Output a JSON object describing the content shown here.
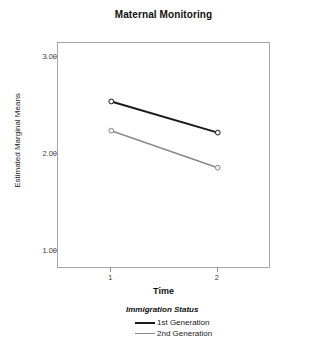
{
  "chart_data": {
    "type": "line",
    "title": "Maternal Monitoring",
    "xlabel": "Time",
    "ylabel": "Estimated Marginal Means",
    "x": [
      1,
      2
    ],
    "xticklabels": [
      "1",
      "2"
    ],
    "yticklabels": [
      "1.00",
      "2.00",
      "3.00"
    ],
    "yticks": [
      1.0,
      2.0,
      3.0
    ],
    "ylim": [
      0.82,
      3.14
    ],
    "xlim": [
      0.5,
      2.5
    ],
    "grid": false,
    "legend_position": "below-center",
    "legend_title": "Immigration Status",
    "series": [
      {
        "name": "1st Generation",
        "color": "#1a1a1a",
        "values": [
          2.54,
          2.22
        ]
      },
      {
        "name": "2nd Generation",
        "color": "#8a8a8a",
        "values": [
          2.24,
          1.86
        ]
      }
    ]
  },
  "colors": {
    "frame": "#a6a6a6",
    "tick": "#8c8c8c",
    "series_1": "#1a1a1a",
    "series_2": "#8a8a8a",
    "marker_fill": "#f2f2f2"
  }
}
